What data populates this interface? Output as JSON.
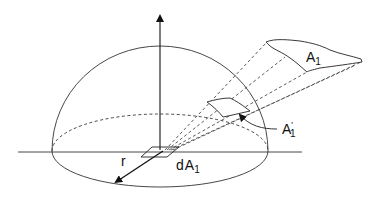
{
  "diagram": {
    "labels": {
      "a1": "A",
      "a1_sub": "1",
      "a1_prime": "A",
      "a1_prime_sub": "1",
      "a1_prime_mark": "'",
      "da1_d": "d",
      "da1_a": "A",
      "da1_sub": "1",
      "radius": "r"
    },
    "colors": {
      "stroke": "#222222",
      "background": "#ffffff"
    }
  }
}
